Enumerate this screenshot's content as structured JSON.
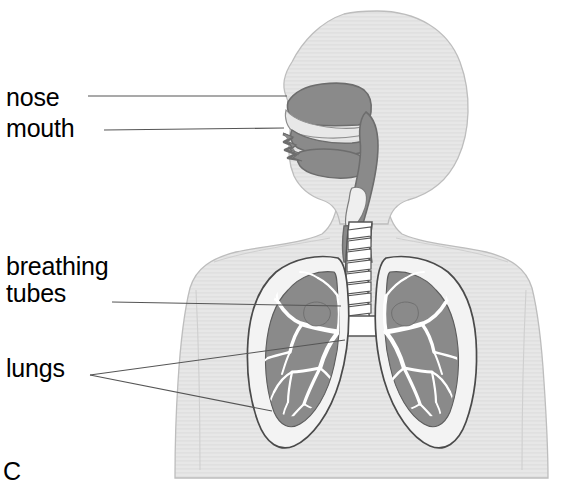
{
  "diagram": {
    "background_color": "#ffffff",
    "labels": [
      {
        "id": "nose",
        "text": "nose",
        "x": 6,
        "y": 84
      },
      {
        "id": "mouth",
        "text": "mouth",
        "x": 6,
        "y": 115
      },
      {
        "id": "breathing-line1",
        "text": "breathing",
        "x": 6,
        "y": 253
      },
      {
        "id": "breathing-line2",
        "text": "tubes",
        "x": 6,
        "y": 281
      },
      {
        "id": "lungs",
        "text": "lungs",
        "x": 6,
        "y": 355
      },
      {
        "id": "partial-bottom",
        "text": "C",
        "x": 3,
        "y": 458
      }
    ],
    "leader_lines": [
      {
        "id": "leader-nose",
        "from_x": 88,
        "from_y": 96,
        "to_x": 287,
        "to_y": 96
      },
      {
        "id": "leader-mouth",
        "from_x": 104,
        "from_y": 130,
        "to_x": 284,
        "to_y": 128
      },
      {
        "id": "leader-breathing",
        "from_x": 112,
        "from_y": 302,
        "to_x": 341,
        "to_y": 306
      },
      {
        "id": "leader-lungs-up",
        "from_x": 90,
        "from_y": 375,
        "to_x": 345,
        "to_y": 340
      },
      {
        "id": "leader-lungs-dn",
        "from_x": 90,
        "from_y": 375,
        "to_x": 272,
        "to_y": 411
      }
    ],
    "colors": {
      "body_fill": "#e4e4e4",
      "body_stroke": "#b9b9b9",
      "airway_fill": "#8a8a8a",
      "airway_stroke": "#6f6f6f",
      "lung_outer_fill": "#f2f2f2",
      "lung_outer_stroke": "#4a4a4a",
      "lung_tissue_fill": "#8a8a8a",
      "bronchi_fill": "#ffffff",
      "bronchi_stroke": "#555555",
      "trachea_fill": "#ffffff",
      "trachea_stroke": "#555555",
      "leader_line": "#555555",
      "label_text": "#000000",
      "scanline": "#dadada"
    },
    "parts": [
      {
        "name": "head-silhouette",
        "description": "rounded head profile facing left"
      },
      {
        "name": "neck-silhouette",
        "description": "neck joining head to torso"
      },
      {
        "name": "torso-silhouette",
        "description": "shoulders and upper chest"
      },
      {
        "name": "nasal-cavity",
        "description": "dark grey nasal passage above palate"
      },
      {
        "name": "oral-cavity",
        "description": "mouth cavity with tongue and uvula"
      },
      {
        "name": "pharynx",
        "description": "throat passage descending to larynx"
      },
      {
        "name": "trachea",
        "description": "windpipe with cartilage rings"
      },
      {
        "name": "bronchus-left",
        "description": "primary bronchus entering left lung"
      },
      {
        "name": "bronchus-right",
        "description": "primary bronchus entering right lung"
      },
      {
        "name": "lung-left",
        "description": "left lung with bronchial tree"
      },
      {
        "name": "lung-right",
        "description": "right lung with bronchial tree"
      }
    ]
  }
}
